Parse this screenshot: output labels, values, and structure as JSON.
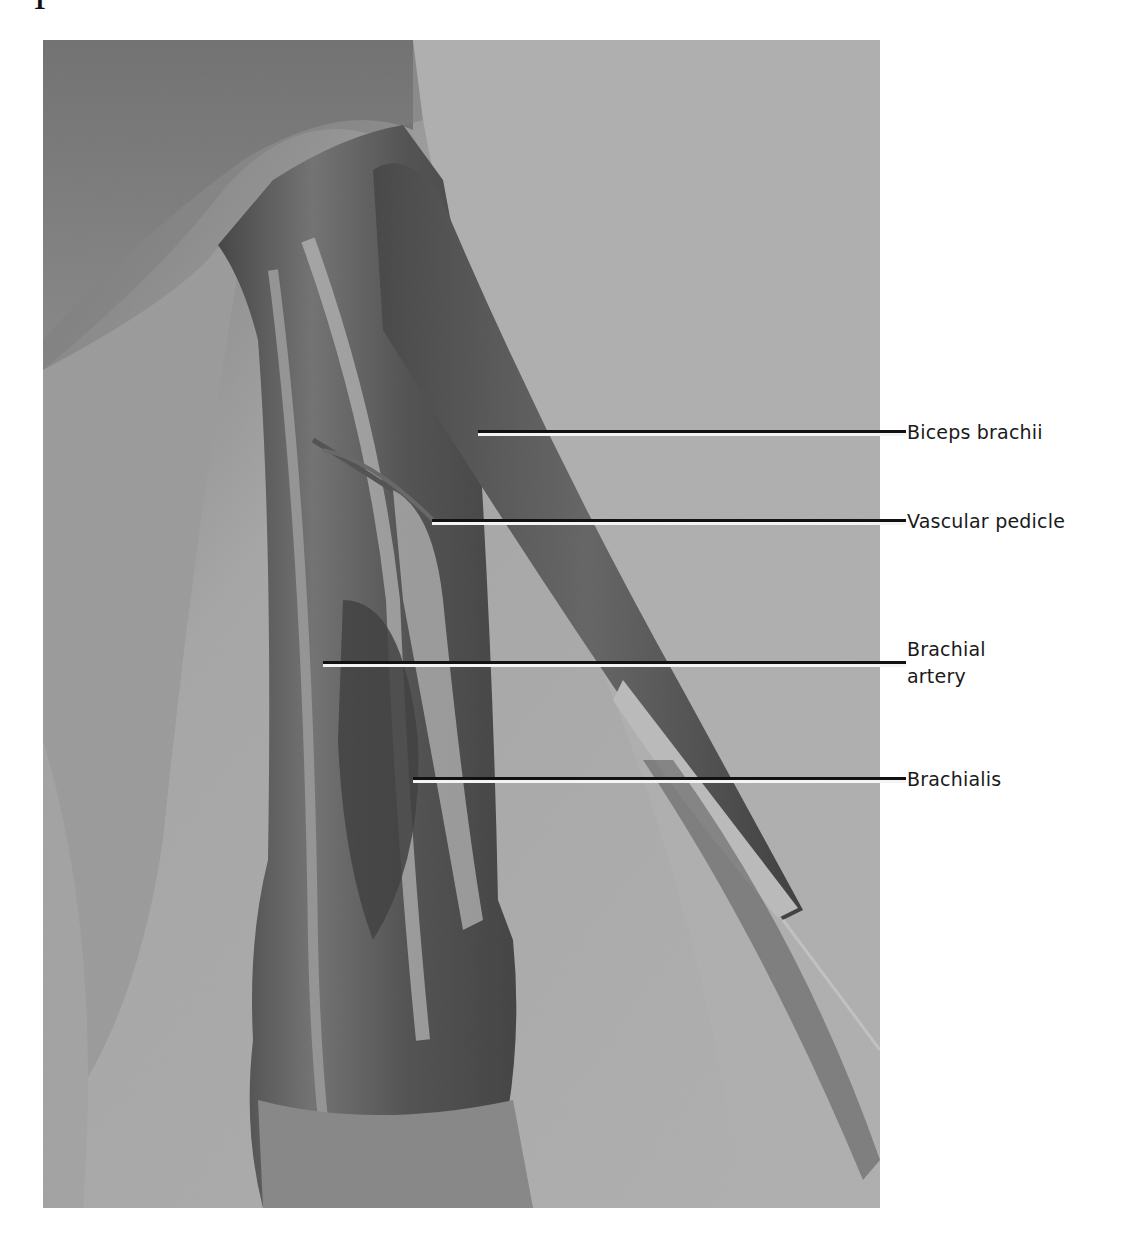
{
  "figure": {
    "page_mark": "1",
    "photo": {
      "description": "Black-and-white cadaver dissection photograph of the anterior arm showing exposed muscles and vessels",
      "tone": "grayscale"
    },
    "labels": [
      {
        "id": "biceps-brachii",
        "text": "Biceps brachii",
        "line_start_x": 478,
        "line_y": 431
      },
      {
        "id": "vascular-pedicle",
        "text": "Vascular pedicle",
        "line_start_x": 432,
        "line_y": 520
      },
      {
        "id": "brachial-artery",
        "text_line1": "Brachial",
        "text_line2": "artery",
        "line_start_x": 323,
        "line_y": 662
      },
      {
        "id": "brachialis",
        "text": "Brachialis",
        "line_start_x": 413,
        "line_y": 778
      }
    ]
  }
}
